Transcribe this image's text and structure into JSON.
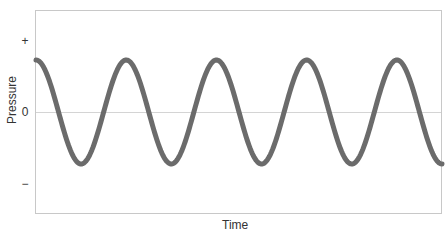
{
  "chart_data": {
    "type": "line",
    "title": "",
    "xlabel": "Time",
    "ylabel": "Pressure",
    "y_ticks": [
      "+",
      "0",
      "−"
    ],
    "x_ticks": [],
    "grid": false,
    "zero_line": true,
    "legend": null,
    "ylim": [
      -1.4,
      1.4
    ],
    "xlim": [
      0,
      4.5
    ],
    "series": [
      {
        "name": "Pressure wave",
        "shape": "sine",
        "amplitude": 1,
        "cycles": 4.5,
        "phase": "starts at peak",
        "color": "#6b6b6b",
        "x": [
          0,
          0.5,
          1,
          1.5,
          2,
          2.5,
          3,
          3.5,
          4,
          4.5
        ],
        "values": [
          1,
          -1,
          1,
          -1,
          1,
          -1,
          1,
          -1,
          1,
          -1
        ]
      }
    ]
  },
  "labels": {
    "x_axis": "Time",
    "y_axis": "Pressure",
    "tick_plus": "+",
    "tick_zero": "0",
    "tick_minus": "−"
  },
  "colors": {
    "wave": "#6b6b6b",
    "frame": "#c8c8c8",
    "zero_line": "#d4d4d4",
    "text": "#333333"
  }
}
